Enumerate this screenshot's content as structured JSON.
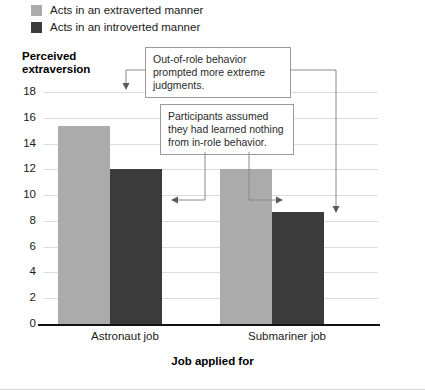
{
  "legend": {
    "items": [
      {
        "label": "Acts in an extraverted manner",
        "color": "#ababab",
        "key": "extraverted"
      },
      {
        "label": "Acts in an introverted manner",
        "color": "#3b3b3b",
        "key": "introverted"
      }
    ]
  },
  "annotations": [
    {
      "id": "callout-1",
      "text": "Out-of-role behavior prompted more extreme judgments."
    },
    {
      "id": "callout-2",
      "text": "Participants assumed they had learned nothing from in-role behavior."
    }
  ],
  "chart_data": {
    "type": "bar",
    "title": "",
    "xlabel": "Job applied for",
    "ylabel": "Perceived extraversion",
    "categories": [
      "Astronaut job",
      "Submariner job"
    ],
    "series": [
      {
        "name": "Acts in an extraverted manner",
        "color": "#ababab",
        "values": [
          15.4,
          12.0
        ]
      },
      {
        "name": "Acts in an introverted manner",
        "color": "#3b3b3b",
        "values": [
          12.0,
          8.7
        ]
      }
    ],
    "ylim": [
      0,
      18
    ],
    "yticks": [
      0,
      2,
      4,
      6,
      8,
      10,
      12,
      14,
      16,
      18
    ],
    "grid": true,
    "legend_position": "top-left",
    "annotations": [
      "Out-of-role behavior prompted more extreme judgments.",
      "Participants assumed they had learned nothing from in-role behavior."
    ]
  }
}
